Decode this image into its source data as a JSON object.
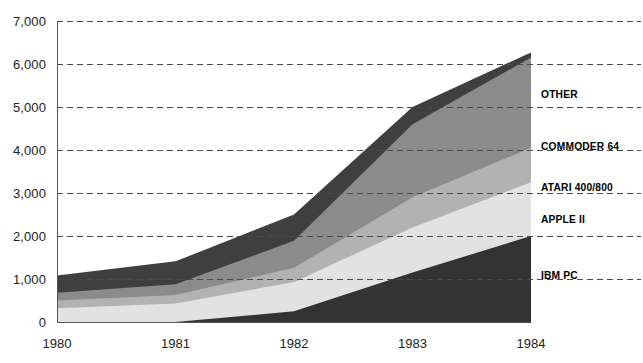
{
  "chart_data": {
    "type": "area",
    "title": "",
    "subtitle": "",
    "xlabel": "",
    "ylabel": "",
    "stacked": true,
    "grid": true,
    "grid_style": "dashed-horizontal",
    "legend_position": "right-inline",
    "x": [
      1980,
      1981,
      1982,
      1983,
      1984
    ],
    "categories": [
      "1980",
      "1981",
      "1982",
      "1983",
      "1984"
    ],
    "xtick_labels": [
      "1980",
      "1981",
      "1982",
      "1983",
      "1984"
    ],
    "ytick_labels": [
      "0",
      "1,000",
      "2,000",
      "3,000",
      "4,000",
      "5,000",
      "6,000",
      "7,000"
    ],
    "ytick_values": [
      0,
      1000,
      2000,
      3000,
      4000,
      5000,
      6000,
      7000
    ],
    "ylim": [
      0,
      7000
    ],
    "xlim": [
      1980,
      1984
    ],
    "series": [
      {
        "name": "IBM PC",
        "values": [
          0,
          0,
          250,
          1150,
          2000
        ],
        "color": "#333333"
      },
      {
        "name": "APPLE II",
        "values": [
          320,
          430,
          680,
          1050,
          1250
        ],
        "color": "#e2e2e2"
      },
      {
        "name": "ATARI 400/800",
        "values": [
          180,
          200,
          330,
          700,
          800
        ],
        "color": "#b2b2b2"
      },
      {
        "name": "COMMODER 64",
        "values": [
          180,
          250,
          630,
          1700,
          2100
        ],
        "color": "#8b8b8b"
      },
      {
        "name": "OTHER",
        "values": [
          400,
          530,
          610,
          400,
          120
        ],
        "color": "#3f3f3f"
      }
    ],
    "totals": [
      1080,
      1410,
      2500,
      5000,
      6270
    ],
    "legend": [
      {
        "label": "OTHER",
        "y_value": 5300
      },
      {
        "label": "COMMODER 64",
        "y_value": 4100
      },
      {
        "label": "ATARI 400/800",
        "y_value": 3150
      },
      {
        "label": "APPLE II",
        "y_value": 2400
      },
      {
        "label": "IBM PC",
        "y_value": 1100
      }
    ],
    "axis_color": "#555555",
    "grid_color": "#4a4a4a",
    "background": "#ffffff"
  }
}
